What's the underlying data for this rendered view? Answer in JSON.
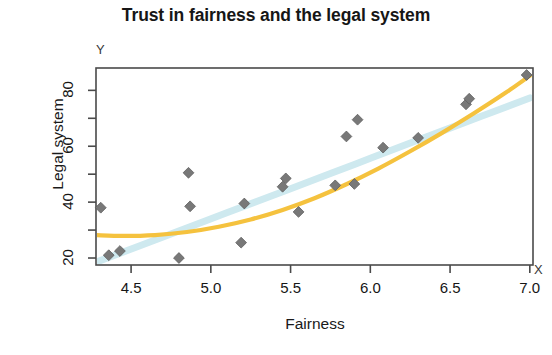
{
  "chart_data": {
    "type": "scatter",
    "title": "Trust in fairness and the legal system",
    "xlabel": "Fairness",
    "ylabel": "Legal system",
    "x_axis_marker": "X",
    "y_axis_marker": "Y",
    "xlim": [
      4.28,
      7.02
    ],
    "ylim": [
      17.5,
      88.0
    ],
    "xticks": [
      4.5,
      5.0,
      5.5,
      6.0,
      6.5,
      7.0
    ],
    "xtick_labels": [
      "4.5",
      "5.0",
      "5.5",
      "6.0",
      "6.5",
      "7.0"
    ],
    "yticks": [
      20,
      30,
      40,
      50,
      60,
      70,
      80
    ],
    "ytick_labels": [
      "20",
      "",
      "40",
      "",
      "60",
      "",
      "80"
    ],
    "grid": false,
    "legend": false,
    "marker": "diamond",
    "marker_color": "#787878",
    "points": [
      {
        "x": 4.31,
        "y": 38.0
      },
      {
        "x": 4.36,
        "y": 21.0
      },
      {
        "x": 4.43,
        "y": 22.5
      },
      {
        "x": 4.8,
        "y": 20.0
      },
      {
        "x": 4.86,
        "y": 50.5
      },
      {
        "x": 4.87,
        "y": 38.5
      },
      {
        "x": 5.19,
        "y": 25.5
      },
      {
        "x": 5.21,
        "y": 39.5
      },
      {
        "x": 5.45,
        "y": 45.5
      },
      {
        "x": 5.47,
        "y": 48.5
      },
      {
        "x": 5.55,
        "y": 36.5
      },
      {
        "x": 5.78,
        "y": 46.0
      },
      {
        "x": 5.85,
        "y": 63.5
      },
      {
        "x": 5.9,
        "y": 46.5
      },
      {
        "x": 5.92,
        "y": 69.5
      },
      {
        "x": 6.08,
        "y": 59.5
      },
      {
        "x": 6.3,
        "y": 63.0
      },
      {
        "x": 6.6,
        "y": 75.0
      },
      {
        "x": 6.62,
        "y": 77.0
      },
      {
        "x": 6.98,
        "y": 85.5
      }
    ],
    "curves": [
      {
        "name": "loess-fit",
        "color": "#F5C23E",
        "width": 4.2,
        "points": [
          {
            "x": 4.28,
            "y": 28.2
          },
          {
            "x": 4.45,
            "y": 27.9
          },
          {
            "x": 4.65,
            "y": 28.2
          },
          {
            "x": 4.85,
            "y": 29.3
          },
          {
            "x": 5.05,
            "y": 31.2
          },
          {
            "x": 5.25,
            "y": 33.8
          },
          {
            "x": 5.45,
            "y": 37.2
          },
          {
            "x": 5.65,
            "y": 41.4
          },
          {
            "x": 5.85,
            "y": 46.4
          },
          {
            "x": 6.05,
            "y": 52.0
          },
          {
            "x": 6.25,
            "y": 58.2
          },
          {
            "x": 6.45,
            "y": 64.8
          },
          {
            "x": 6.65,
            "y": 71.8
          },
          {
            "x": 6.85,
            "y": 79.2
          },
          {
            "x": 7.0,
            "y": 85.2
          }
        ]
      },
      {
        "name": "linear-fit-band",
        "color": "#CEE9EF",
        "width": 7.0,
        "points": [
          {
            "x": 4.28,
            "y": 18.5
          },
          {
            "x": 4.7,
            "y": 27.5
          },
          {
            "x": 5.1,
            "y": 36.2
          },
          {
            "x": 5.5,
            "y": 44.8
          },
          {
            "x": 5.9,
            "y": 53.5
          },
          {
            "x": 6.3,
            "y": 62.2
          },
          {
            "x": 6.7,
            "y": 70.8
          },
          {
            "x": 7.0,
            "y": 77.3
          }
        ]
      }
    ]
  },
  "plot_geometry": {
    "left": 96,
    "right": 533,
    "top": 68,
    "bottom": 265,
    "frame_color": "#4a4a4a"
  }
}
